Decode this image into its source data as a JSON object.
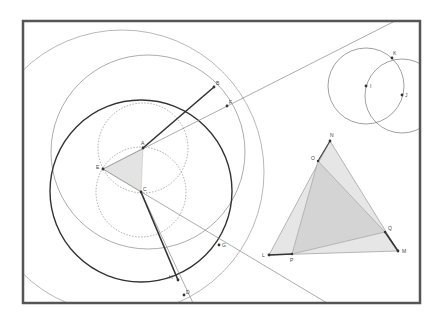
{
  "diagram": {
    "type": "geometric-construction",
    "colors": {
      "frame": "#555555",
      "thin_line": "#888888",
      "thick_line": "#333333",
      "fill": "#e3e3e3",
      "inner_fill": "#d2d2d2",
      "point": "#333333"
    },
    "points": [
      {
        "id": "A",
        "label": "A"
      },
      {
        "id": "B",
        "label": "B"
      },
      {
        "id": "C",
        "label": "C"
      },
      {
        "id": "D",
        "label": "D"
      },
      {
        "id": "E",
        "label": "E"
      },
      {
        "id": "F",
        "label": "F"
      },
      {
        "id": "G",
        "label": "G"
      },
      {
        "id": "H",
        "label": "H"
      },
      {
        "id": "I",
        "label": "I"
      },
      {
        "id": "J",
        "label": "J"
      },
      {
        "id": "K",
        "label": "K"
      },
      {
        "id": "L",
        "label": "L"
      },
      {
        "id": "M",
        "label": "M"
      },
      {
        "id": "N",
        "label": "N"
      },
      {
        "id": "O",
        "label": "O"
      },
      {
        "id": "P",
        "label": "P"
      },
      {
        "id": "Q",
        "label": "Q"
      }
    ],
    "shapes": {
      "triangle_ASC": "shaded triangle E-A-C",
      "triangle_LMN": "shaded triangle L-M-N",
      "triangle_OPQ": "shaded inner triangle O-P-Q",
      "thick_segments": [
        "A-B",
        "C-H",
        "L-P",
        "Q-M",
        "O-N"
      ],
      "circles": [
        "circle about C (thick)",
        "circle through B",
        "outer circle through B",
        "dotted circle about A",
        "dotted circle about C",
        "circle about I",
        "circle about J"
      ]
    }
  }
}
